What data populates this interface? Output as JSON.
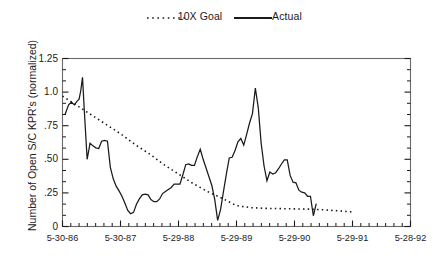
{
  "chart_data": {
    "type": "line",
    "title": "",
    "xlabel": "",
    "ylabel": "Number of Open S/C KPR's (normalized)",
    "ylim": [
      0,
      1.25
    ],
    "yticks": [
      "0",
      ".25",
      ".50",
      ".75",
      "1.0",
      "1.25"
    ],
    "ytick_values": [
      0,
      0.25,
      0.5,
      0.75,
      1.0,
      1.25
    ],
    "xticks": [
      "5-30-86",
      "5-30-87",
      "5-29-88",
      "5-29-89",
      "5-29-90",
      "5-29-91",
      "5-28-92"
    ],
    "xtick_values": [
      0,
      1,
      2,
      3,
      4,
      5,
      6
    ],
    "xlim": [
      0,
      6
    ],
    "grid": false,
    "legend_position": "top-center",
    "minor_ticks_per_interval": 6,
    "series": [
      {
        "name": "10X Goal",
        "style": "dotted",
        "color": "#1a1a1a",
        "x": [
          0.0,
          0.25,
          0.5,
          0.75,
          1.0,
          1.25,
          1.5,
          1.75,
          2.0,
          2.25,
          2.5,
          2.75,
          3.0,
          3.25,
          3.5,
          3.75,
          4.0,
          4.25,
          4.5,
          4.75,
          5.0
        ],
        "values": [
          0.97,
          0.9,
          0.83,
          0.76,
          0.69,
          0.61,
          0.54,
          0.46,
          0.39,
          0.32,
          0.26,
          0.21,
          0.155,
          0.14,
          0.135,
          0.133,
          0.131,
          0.129,
          0.124,
          0.117,
          0.108
        ]
      },
      {
        "name": "Actual",
        "style": "solid",
        "color": "#1a1a1a",
        "x": [
          0.045,
          0.105,
          0.155,
          0.205,
          0.255,
          0.285,
          0.315,
          0.345,
          0.375,
          0.425,
          0.475,
          0.525,
          0.575,
          0.625,
          0.675,
          0.725,
          0.775,
          0.825,
          0.875,
          0.925,
          0.975,
          1.025,
          1.075,
          1.125,
          1.175,
          1.225,
          1.275,
          1.325,
          1.375,
          1.425,
          1.475,
          1.525,
          1.575,
          1.625,
          1.675,
          1.725,
          1.775,
          1.825,
          1.875,
          1.925,
          1.975,
          2.025,
          2.075,
          2.125,
          2.175,
          2.225,
          2.275,
          2.325,
          2.375,
          2.425,
          2.475,
          2.525,
          2.575,
          2.625,
          2.675,
          2.725,
          2.775,
          2.825,
          2.875,
          2.925,
          2.975,
          3.025,
          3.075,
          3.125,
          3.175,
          3.225,
          3.275,
          3.325,
          3.375,
          3.425,
          3.475,
          3.525,
          3.575,
          3.625,
          3.675,
          3.725,
          3.775,
          3.825,
          3.875,
          3.925,
          3.975,
          4.025,
          4.075,
          4.125,
          4.175,
          4.225,
          4.275,
          4.325,
          4.375
        ],
        "values": [
          0.835,
          0.905,
          0.925,
          0.905,
          0.935,
          0.945,
          1.01,
          1.11,
          0.87,
          0.5,
          0.62,
          0.6,
          0.585,
          0.58,
          0.635,
          0.64,
          0.635,
          0.44,
          0.355,
          0.3,
          0.265,
          0.225,
          0.175,
          0.12,
          0.095,
          0.105,
          0.165,
          0.205,
          0.235,
          0.24,
          0.235,
          0.2,
          0.185,
          0.185,
          0.205,
          0.245,
          0.26,
          0.275,
          0.29,
          0.315,
          0.315,
          0.315,
          0.385,
          0.46,
          0.465,
          0.455,
          0.455,
          0.52,
          0.575,
          0.5,
          0.435,
          0.37,
          0.305,
          0.2,
          0.045,
          0.125,
          0.26,
          0.39,
          0.51,
          0.515,
          0.565,
          0.63,
          0.655,
          0.605,
          0.685,
          0.77,
          0.84,
          1.03,
          0.885,
          0.62,
          0.45,
          0.34,
          0.405,
          0.39,
          0.4,
          0.43,
          0.465,
          0.495,
          0.495,
          0.38,
          0.33,
          0.325,
          0.27,
          0.255,
          0.25,
          0.225,
          0.225,
          0.08,
          0.17
        ]
      }
    ]
  },
  "legend": {
    "goal_label": "10X Goal",
    "actual_label": "Actual"
  },
  "axes": {
    "y_title": "Number of Open S/C KPR's (normalized)"
  }
}
